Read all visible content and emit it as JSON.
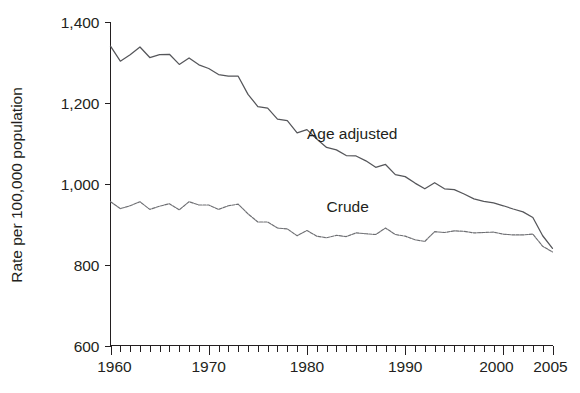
{
  "chart_data": {
    "type": "line",
    "title": "",
    "subtitle": "",
    "xlabel": "",
    "ylabel": "Rate per 100,000 population",
    "xlim": [
      1960,
      2005
    ],
    "ylim": [
      600,
      1400
    ],
    "grid": false,
    "legend_position": "inline-annotation",
    "y_ticks": [
      600,
      800,
      1000,
      1200,
      1400
    ],
    "y_tick_labels": [
      "600",
      "800",
      "1,000",
      "1,200",
      "1,400"
    ],
    "x_ticks": [
      1960,
      1970,
      1980,
      1990,
      2000,
      2005
    ],
    "x_tick_labels": [
      "1960",
      "1970",
      "1980",
      "1990",
      "2000",
      "2005"
    ],
    "x_minor_tick_interval": 1,
    "annotations": [
      {
        "text": "Age adjusted",
        "x": 1980,
        "y": 1110
      },
      {
        "text": "Crude",
        "x": 1982,
        "y": 930
      }
    ],
    "x": [
      1960,
      1961,
      1962,
      1963,
      1964,
      1965,
      1966,
      1967,
      1968,
      1969,
      1970,
      1971,
      1972,
      1973,
      1974,
      1975,
      1976,
      1977,
      1978,
      1979,
      1980,
      1981,
      1982,
      1983,
      1984,
      1985,
      1986,
      1987,
      1988,
      1989,
      1990,
      1991,
      1992,
      1993,
      1994,
      1995,
      1996,
      1997,
      1998,
      1999,
      2000,
      2001,
      2002,
      2003,
      2004,
      2005
    ],
    "series": [
      {
        "name": "Age adjusted",
        "style": "solid",
        "color": "#55565a",
        "values": [
          1339,
          1302,
          1318,
          1337,
          1311,
          1318,
          1319,
          1294,
          1310,
          1293,
          1284,
          1269,
          1265,
          1265,
          1220,
          1190,
          1186,
          1159,
          1155,
          1125,
          1133,
          1110,
          1089,
          1083,
          1069,
          1068,
          1056,
          1040,
          1047,
          1022,
          1017,
          1001,
          987,
          1002,
          987,
          985,
          974,
          962,
          956,
          952,
          945,
          937,
          930,
          916,
          871,
          840
        ]
      },
      {
        "name": "Crude",
        "style": "dotted",
        "color": "#6e6f73",
        "values": [
          955,
          938,
          945,
          955,
          936,
          944,
          950,
          935,
          955,
          947,
          947,
          936,
          945,
          949,
          925,
          905,
          905,
          890,
          888,
          871,
          884,
          870,
          866,
          872,
          869,
          878,
          876,
          874,
          890,
          874,
          870,
          861,
          857,
          881,
          879,
          883,
          882,
          878,
          879,
          880,
          875,
          873,
          873,
          875,
          845,
          831
        ]
      }
    ]
  },
  "axis": {
    "y_title": "Rate per 100,000 population"
  }
}
